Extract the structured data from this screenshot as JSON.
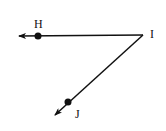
{
  "diagram": {
    "type": "angle",
    "vertex": {
      "name": "I",
      "label": "I",
      "x": 143,
      "y": 35
    },
    "rays": [
      {
        "name": "ray-IH",
        "from": "I",
        "through": "H",
        "end": {
          "x": 19,
          "y": 36
        },
        "point": {
          "label": "H",
          "x": 38,
          "y": 36
        },
        "label_pos": {
          "x": 38,
          "y": 28
        }
      },
      {
        "name": "ray-IJ",
        "from": "I",
        "through": "J",
        "end": {
          "x": 55,
          "y": 115
        },
        "point": {
          "label": "J",
          "x": 68,
          "y": 102
        },
        "label_pos": {
          "x": 78,
          "y": 117
        }
      }
    ],
    "labels": {
      "H": "H",
      "I": "I",
      "J": "J"
    },
    "colors": {
      "stroke": "#111111",
      "background": "#ffffff"
    }
  }
}
